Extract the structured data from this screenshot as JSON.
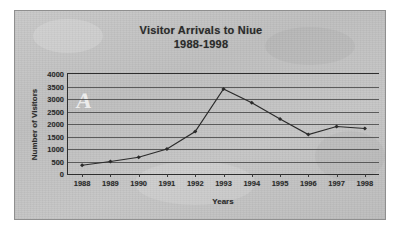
{
  "figure": {
    "title_line1": "Visitor Arrivals to Niue",
    "title_line2": "1988-1998",
    "watermark": "A",
    "paper_color": "#c3c3c3",
    "ink_color": "#2b2b2b",
    "border_color": "#8f8f8f"
  },
  "chart_data": {
    "type": "line",
    "title": "Visitor Arrivals to Niue 1988-1998",
    "xlabel": "Years",
    "ylabel": "Number of Visitors",
    "categories": [
      "1988",
      "1989",
      "1990",
      "1991",
      "1992",
      "1993",
      "1994",
      "1995",
      "1996",
      "1997",
      "1998"
    ],
    "values": [
      350,
      500,
      670,
      1000,
      1700,
      3400,
      2850,
      2200,
      1580,
      1900,
      1820
    ],
    "ylim": [
      0,
      4000
    ],
    "yticks": [
      4000,
      3500,
      3000,
      2500,
      2000,
      1500,
      1000,
      500,
      0
    ],
    "grid": true,
    "legend": "none",
    "marker": "filled-diamond",
    "line_color": "#2b2b2b"
  }
}
